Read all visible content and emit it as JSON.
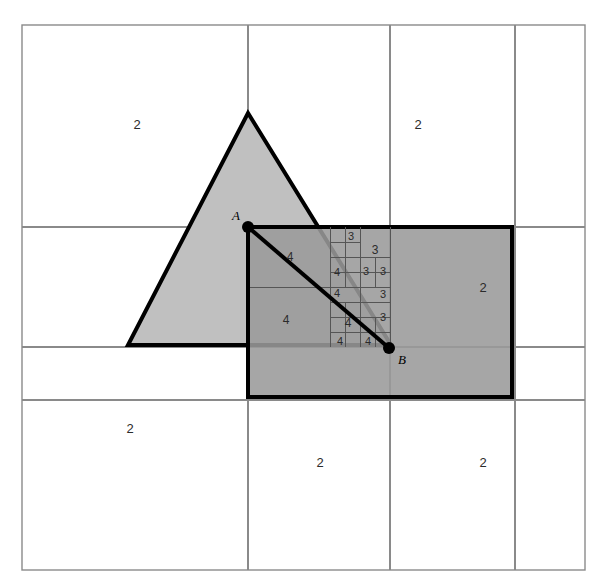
{
  "figure": {
    "type": "diagram",
    "canvas": {
      "width": 601,
      "height": 582
    },
    "frame": {
      "x": 22,
      "y": 25,
      "width": 563,
      "height": 545,
      "stroke": "#8a8a8a",
      "stroke_width": 1.4
    }
  },
  "colors": {
    "background": "#ffffff",
    "triangle_fill": "#c0c0c0",
    "rectangle_fill": "#9a9a9a",
    "overlap_fill": "#8a8a8a",
    "shape_stroke": "#000000",
    "grid_stroke": "#8a8a8a",
    "cell_stroke": "#555555",
    "label_color": "#2b2b2b",
    "point_color": "#000000"
  },
  "shapes": {
    "triangle": {
      "name": "triangle",
      "points": "248,113 391,345 128,345",
      "fill": "#c0c0c0",
      "stroke": "#000000",
      "stroke_width": 4
    },
    "rectangle": {
      "name": "rectangle",
      "x": 248,
      "y": 227,
      "width": 264,
      "height": 170,
      "fill": "#9a9a9a",
      "stroke": "#000000",
      "stroke_width": 4
    },
    "chord": {
      "name": "chord-A-B",
      "x1": 248,
      "y1": 227,
      "x2": 389,
      "y2": 348,
      "stroke": "#000000",
      "stroke_width": 4
    }
  },
  "points": [
    {
      "id": "A",
      "label": "A",
      "x": 248,
      "y": 227,
      "label_x": 236,
      "label_y": 216,
      "radius": 6
    },
    {
      "id": "B",
      "label": "B",
      "x": 389,
      "y": 348,
      "label_x": 402,
      "label_y": 360,
      "radius": 6
    }
  ],
  "dashed_guides": [
    {
      "name": "dashed-horizontal-from-A",
      "x1": 248,
      "y1": 227,
      "x2": 330,
      "y2": 227
    },
    {
      "name": "dashed-vertical-from-A",
      "x1": 248,
      "y1": 227,
      "x2": 248,
      "y2": 345
    }
  ],
  "grid": {
    "vertical": [
      {
        "x": 248,
        "y1": 25,
        "y2": 570
      },
      {
        "x": 390,
        "y1": 25,
        "y2": 570
      },
      {
        "x": 515,
        "y1": 25,
        "y2": 570
      }
    ],
    "horizontal": [
      {
        "y": 227,
        "x1": 22,
        "x2": 585
      },
      {
        "y": 347,
        "x1": 22,
        "x2": 585
      },
      {
        "y": 400,
        "x1": 22,
        "x2": 585
      }
    ]
  },
  "cell_lines": [
    {
      "name": "cell-line-h-287",
      "x1": 248,
      "y1": 287,
      "x2": 330,
      "y2": 287
    },
    {
      "name": "cell-line-v-330",
      "x1": 330,
      "y1": 227,
      "x2": 330,
      "y2": 347
    },
    {
      "name": "cell-line-v-360",
      "x1": 360,
      "y1": 227,
      "x2": 360,
      "y2": 347
    },
    {
      "name": "cell-line-v-390",
      "x1": 390,
      "y1": 227,
      "x2": 390,
      "y2": 347
    },
    {
      "name": "cell-line-h-257",
      "x1": 330,
      "y1": 257,
      "x2": 390,
      "y2": 257
    },
    {
      "name": "cell-line-h-272",
      "x1": 330,
      "y1": 272,
      "x2": 390,
      "y2": 272
    },
    {
      "name": "cell-line-h-287b",
      "x1": 330,
      "y1": 287,
      "x2": 390,
      "y2": 287
    },
    {
      "name": "cell-line-h-302",
      "x1": 330,
      "y1": 302,
      "x2": 390,
      "y2": 302
    },
    {
      "name": "cell-line-h-317",
      "x1": 330,
      "y1": 317,
      "x2": 390,
      "y2": 317
    },
    {
      "name": "cell-line-h-332",
      "x1": 330,
      "y1": 332,
      "x2": 390,
      "y2": 332
    },
    {
      "name": "cell-line-h-242",
      "x1": 330,
      "y1": 242,
      "x2": 360,
      "y2": 242
    },
    {
      "name": "cell-line-v-345a",
      "x1": 345,
      "y1": 227,
      "x2": 345,
      "y2": 257
    },
    {
      "name": "cell-line-v-345b",
      "x1": 345,
      "y1": 257,
      "x2": 345,
      "y2": 287
    },
    {
      "name": "cell-line-v-375a",
      "x1": 375,
      "y1": 257,
      "x2": 375,
      "y2": 287
    },
    {
      "name": "cell-line-v-345c",
      "x1": 345,
      "y1": 302,
      "x2": 345,
      "y2": 347
    },
    {
      "name": "cell-line-v-375b",
      "x1": 375,
      "y1": 317,
      "x2": 375,
      "y2": 347
    },
    {
      "name": "cell-line-v-360b",
      "x1": 360,
      "y1": 302,
      "x2": 360,
      "y2": 317
    }
  ],
  "cell_labels": [
    {
      "id": "q-nw",
      "text": "2",
      "x": 137,
      "y": 124,
      "size": "quad"
    },
    {
      "id": "q-ne",
      "text": "2",
      "x": 418,
      "y": 124,
      "size": "quad"
    },
    {
      "id": "q-e",
      "text": "2",
      "x": 483,
      "y": 287,
      "size": "quad"
    },
    {
      "id": "q-sw",
      "text": "2",
      "x": 130,
      "y": 428,
      "size": "quad"
    },
    {
      "id": "q-s",
      "text": "2",
      "x": 320,
      "y": 462,
      "size": "quad"
    },
    {
      "id": "q-se",
      "text": "2",
      "x": 483,
      "y": 462,
      "size": "quad"
    },
    {
      "id": "c-4-a",
      "text": "4",
      "x": 290,
      "y": 257,
      "size": "cell"
    },
    {
      "id": "c-4-b",
      "text": "4",
      "x": 286,
      "y": 320,
      "size": "cell"
    },
    {
      "id": "c-3-a",
      "text": "3",
      "x": 351,
      "y": 236,
      "size": "cell-sm"
    },
    {
      "id": "c-3-b",
      "text": "3",
      "x": 375,
      "y": 250,
      "size": "cell"
    },
    {
      "id": "c-4-c",
      "text": "4",
      "x": 337,
      "y": 272,
      "size": "cell-sm"
    },
    {
      "id": "c-3-c",
      "text": "3",
      "x": 366,
      "y": 271,
      "size": "cell-sm"
    },
    {
      "id": "c-3-d",
      "text": "3",
      "x": 383,
      "y": 271,
      "size": "cell-sm"
    },
    {
      "id": "c-4-d",
      "text": "4",
      "x": 337,
      "y": 293,
      "size": "cell-sm"
    },
    {
      "id": "c-3-e",
      "text": "3",
      "x": 383,
      "y": 294,
      "size": "cell-sm"
    },
    {
      "id": "c-3-f",
      "text": "3",
      "x": 383,
      "y": 317,
      "size": "cell-sm"
    },
    {
      "id": "c-4-e",
      "text": "4",
      "x": 348,
      "y": 323,
      "size": "cell"
    },
    {
      "id": "c-4-f",
      "text": "4",
      "x": 340,
      "y": 341,
      "size": "cell-sm"
    },
    {
      "id": "c-4-g",
      "text": "4",
      "x": 368,
      "y": 341,
      "size": "cell-sm"
    }
  ],
  "chart_data": {
    "type": "diagram",
    "depth_labels": [
      "2",
      "3",
      "4"
    ],
    "legend_note": "Numbers denote quadtree cell depth",
    "annotated_points": [
      "A",
      "B"
    ],
    "counts_by_depth": {
      "2": 6,
      "3": 7,
      "4": 7
    }
  }
}
